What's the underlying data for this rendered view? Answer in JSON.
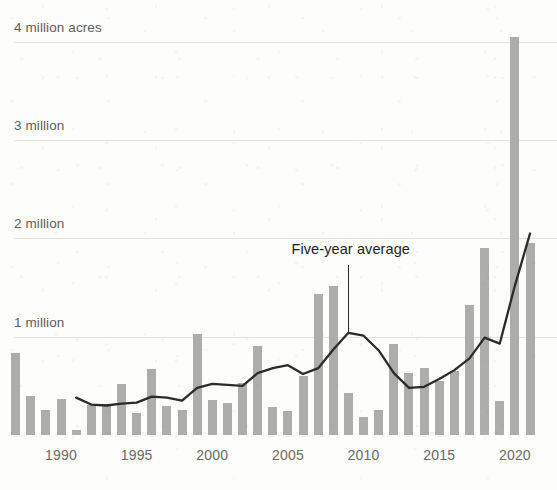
{
  "chart_data": {
    "type": "bar",
    "title": "",
    "subtitle": "",
    "xlabel": "",
    "ylabel": "",
    "ylim": [
      0,
      4.3
    ],
    "xlim": [
      1986.4,
      2021.6
    ],
    "grid": true,
    "legend_position": "none",
    "units": "million acres",
    "y_tick_labels": [
      "4 million acres",
      "3 million",
      "2 million",
      "1 million"
    ],
    "y_tick_values": [
      4,
      3,
      2,
      1
    ],
    "x_tick_labels": [
      "1990",
      "1995",
      "2000",
      "2005",
      "2010",
      "2015",
      "2020"
    ],
    "x_tick_values": [
      1990,
      1995,
      2000,
      2005,
      2010,
      2015,
      2020
    ],
    "categories": [
      1987,
      1988,
      1989,
      1990,
      1991,
      1992,
      1993,
      1994,
      1995,
      1996,
      1997,
      1998,
      1999,
      2000,
      2001,
      2002,
      2003,
      2004,
      2005,
      2006,
      2007,
      2008,
      2009,
      2010,
      2011,
      2012,
      2013,
      2014,
      2015,
      2016,
      2017,
      2018,
      2019,
      2020,
      2021
    ],
    "series": [
      {
        "name": "Acres burned",
        "type": "bar",
        "color": "#adadab",
        "values": [
          0.83,
          0.4,
          0.25,
          0.37,
          0.05,
          0.31,
          0.32,
          0.52,
          0.22,
          0.67,
          0.3,
          0.25,
          1.03,
          0.36,
          0.33,
          0.53,
          0.91,
          0.28,
          0.24,
          0.6,
          1.43,
          1.52,
          0.43,
          0.18,
          0.25,
          0.93,
          0.63,
          0.68,
          0.55,
          0.65,
          1.32,
          1.9,
          0.35,
          4.05,
          1.95
        ]
      },
      {
        "name": "Five-year average",
        "type": "line",
        "color": "#2b2b29",
        "x": [
          1991,
          1992,
          1993,
          1994,
          1995,
          1996,
          1997,
          1998,
          1999,
          2000,
          2001,
          2002,
          2003,
          2004,
          2005,
          2006,
          2007,
          2008,
          2009,
          2010,
          2011,
          2012,
          2013,
          2014,
          2015,
          2016,
          2017,
          2018,
          2019,
          2020,
          2021
        ],
        "values": [
          0.38,
          0.31,
          0.3,
          0.32,
          0.33,
          0.39,
          0.38,
          0.35,
          0.48,
          0.52,
          0.51,
          0.5,
          0.63,
          0.68,
          0.71,
          0.62,
          0.68,
          0.87,
          1.04,
          1.01,
          0.86,
          0.63,
          0.48,
          0.49,
          0.57,
          0.66,
          0.78,
          0.99,
          0.93,
          1.52,
          2.05
        ]
      }
    ],
    "annotations": [
      {
        "name": "five-year-average-callout",
        "text": "Five-year average",
        "points_to_x": 2009,
        "points_to_y": 1.04
      }
    ]
  },
  "colors": {
    "bar": "#adadab",
    "line": "#2b2b29",
    "grid": "#e3e3df",
    "axis_text": "#6a6a67",
    "y_axis_text": "#5f5f5c",
    "annotation_text": "#1d1d1b",
    "background": "#fdfdfc"
  }
}
